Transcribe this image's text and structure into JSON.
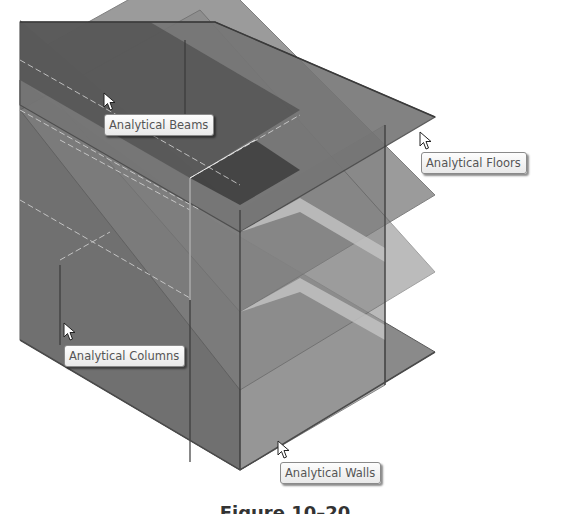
{
  "figure": {
    "caption": "Figure 10–20"
  },
  "callouts": [
    {
      "id": "beams",
      "label": "Analytical Beams",
      "cursor_icon": "arrow-cursor-icon"
    },
    {
      "id": "floors",
      "label": "Analytical Floors",
      "cursor_icon": "arrow-cursor-icon"
    },
    {
      "id": "columns",
      "label": "Analytical Columns",
      "cursor_icon": "arrow-cursor-icon"
    },
    {
      "id": "walls",
      "label": "Analytical Walls",
      "cursor_icon": "arrow-cursor-icon"
    }
  ],
  "colors": {
    "background": "#ffffff",
    "floor_slab": "#7d7d7d",
    "dark_slab": "#4a4a4a",
    "wall_panel": "#9a9a9a",
    "tooltip_bg": "#f4f4f4",
    "tooltip_text": "#555555"
  }
}
